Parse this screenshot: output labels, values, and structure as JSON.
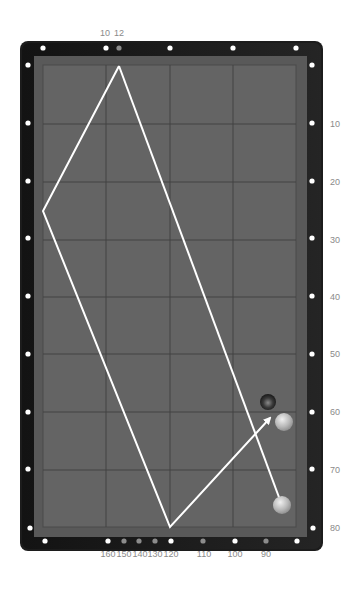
{
  "table": {
    "rail_color": "#1c1c1c",
    "cushion_color": "#5a5a5a",
    "cloth_color": "#636363",
    "grid_color": "#3e3e3e",
    "diamond_color": "#ffffff",
    "marker_color": "#8c8c8c",
    "path_color": "#ffffff"
  },
  "top_labels": [
    {
      "text": "10",
      "x": 105
    },
    {
      "text": "12",
      "x": 119
    }
  ],
  "right_labels": [
    {
      "text": "10",
      "y": 124
    },
    {
      "text": "20",
      "y": 182
    },
    {
      "text": "30",
      "y": 240
    },
    {
      "text": "40",
      "y": 297
    },
    {
      "text": "50",
      "y": 354
    },
    {
      "text": "60",
      "y": 412
    },
    {
      "text": "70",
      "y": 470
    },
    {
      "text": "80",
      "y": 527
    }
  ],
  "bottom_labels": [
    {
      "text": "160",
      "x": 108
    },
    {
      "text": "150",
      "x": 124
    },
    {
      "text": "140",
      "x": 140
    },
    {
      "text": "130",
      "x": 155
    },
    {
      "text": "120",
      "x": 171
    },
    {
      "text": "110",
      "x": 204
    },
    {
      "text": "100",
      "x": 235
    },
    {
      "text": "90",
      "x": 266
    }
  ],
  "balls": [
    {
      "name": "dark-ball",
      "x": 268,
      "y": 402,
      "r": 8
    },
    {
      "name": "object-ball",
      "x": 284,
      "y": 422,
      "r": 9
    },
    {
      "name": "cue-ball",
      "x": 282,
      "y": 505,
      "r": 9
    }
  ],
  "path": {
    "points": "119,66 43,211 170,527 270,418",
    "line2": "119,66 280,500"
  }
}
